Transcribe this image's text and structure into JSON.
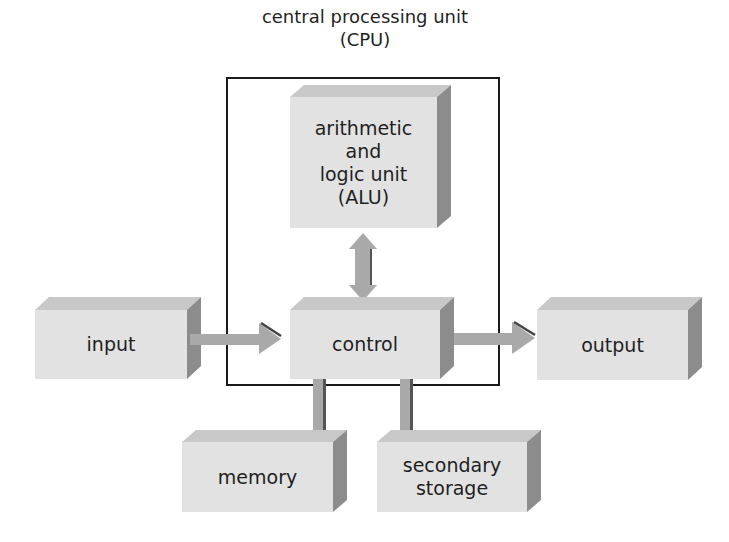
{
  "diagram": {
    "title_line1": "central processing unit",
    "title_line2": "(CPU)",
    "container": {
      "label": "CPU",
      "stroke": "#1a1a1a"
    },
    "nodes": {
      "alu": {
        "label": "arithmetic\nand\nlogic unit\n(ALU)"
      },
      "control": {
        "label": "control"
      },
      "input": {
        "label": "input"
      },
      "output": {
        "label": "output"
      },
      "memory": {
        "label": "memory"
      },
      "storage": {
        "label": "secondary\nstorage"
      }
    },
    "edges": [
      {
        "from": "input",
        "to": "control",
        "type": "arrow"
      },
      {
        "from": "control",
        "to": "output",
        "type": "arrow"
      },
      {
        "from": "alu",
        "to": "control",
        "type": "bidirectional-arrow"
      },
      {
        "from": "control",
        "to": "memory",
        "type": "connector"
      },
      {
        "from": "control",
        "to": "storage",
        "type": "connector"
      }
    ],
    "colors": {
      "front_face": "#e2e2e2",
      "top_face": "#c8c8c8",
      "side_face": "#8c8c8c",
      "arrow_fill": "#a9a9a9",
      "arrow_shadow": "#555555",
      "text": "#1f1f1f"
    }
  }
}
